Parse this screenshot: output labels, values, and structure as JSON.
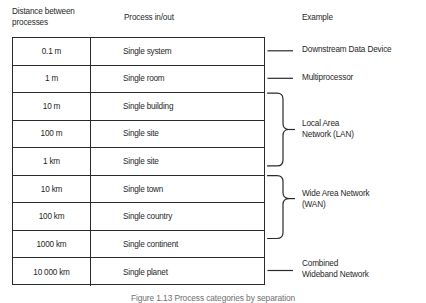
{
  "headers": {
    "distance": "Distance between\nprocesses",
    "process": "Process in/out",
    "example": "Example"
  },
  "rows": [
    {
      "distance": "0.1 m",
      "process": "Single system"
    },
    {
      "distance": "1 m",
      "process": "Single room"
    },
    {
      "distance": "10 m",
      "process": "Single building"
    },
    {
      "distance": "100 m",
      "process": "Single site"
    },
    {
      "distance": "1 km",
      "process": "Single site"
    },
    {
      "distance": "10 km",
      "process": "Single town"
    },
    {
      "distance": "100 km",
      "process": "Single country"
    },
    {
      "distance": "1000 km",
      "process": "Single continent"
    },
    {
      "distance": "10 000 km",
      "process": "Single planet"
    }
  ],
  "examples": [
    {
      "label": "Downstream Data Device",
      "connector": "dash",
      "rows": [
        0
      ]
    },
    {
      "label": "Multiprocessor",
      "connector": "dash",
      "rows": [
        1
      ]
    },
    {
      "label": "Local Area\nNetwork (LAN)",
      "connector": "brace",
      "rows": [
        2,
        3,
        4
      ]
    },
    {
      "label": "Wide Area Network\n(WAN)",
      "connector": "brace",
      "rows": [
        5,
        6,
        7
      ]
    },
    {
      "label": "Combined\nWideband Network",
      "connector": "dash",
      "rows": [
        8
      ]
    }
  ],
  "caption": "Figure 1.13  Process categories by separation",
  "colors": {
    "line": "#2a2a2a",
    "text": "#1f1f1f",
    "caption": "#6f6f6f",
    "background": "#ffffff"
  }
}
